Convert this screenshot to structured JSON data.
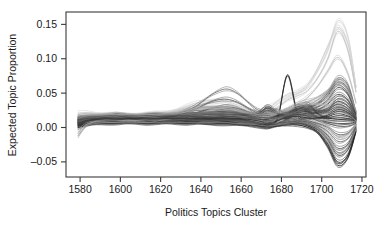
{
  "figure": {
    "background_color": "#ffffff",
    "frame_color": "#3a3a3a",
    "text_color": "#1a1a1a"
  },
  "chart_data": {
    "type": "line",
    "title": "",
    "xlabel": "Politics Topics Cluster",
    "ylabel": "Expected Topic Proportion",
    "xlim": [
      1573,
      1722
    ],
    "ylim": [
      -0.072,
      0.168
    ],
    "xticks": [
      1580,
      1600,
      1620,
      1640,
      1660,
      1680,
      1700,
      1720
    ],
    "xticklabels": [
      "1580",
      "1600",
      "1620",
      "1640",
      "1660",
      "1680",
      "1700",
      "1720"
    ],
    "yticks": [
      -0.05,
      0.0,
      0.05,
      0.1,
      0.15
    ],
    "yticklabels": [
      "-0.05",
      "0.00",
      "0.05",
      "0.10",
      "0.15"
    ],
    "grid": false,
    "legend": "none",
    "x": [
      1579,
      1583,
      1588,
      1593,
      1598,
      1603,
      1608,
      1613,
      1618,
      1623,
      1628,
      1633,
      1638,
      1643,
      1648,
      1653,
      1658,
      1663,
      1668,
      1673,
      1678,
      1683,
      1688,
      1693,
      1698,
      1703,
      1708,
      1713,
      1717
    ],
    "series": [
      {
        "name": "topic-01",
        "color": "#d0d0d0",
        "values": [
          0.021,
          0.022,
          0.021,
          0.02,
          0.019,
          0.019,
          0.02,
          0.02,
          0.021,
          0.023,
          0.026,
          0.031,
          0.036,
          0.039,
          0.04,
          0.038,
          0.033,
          0.027,
          0.024,
          0.028,
          0.038,
          0.048,
          0.052,
          0.062,
          0.086,
          0.118,
          0.146,
          0.122,
          0.06
        ]
      },
      {
        "name": "topic-02",
        "color": "#d6d6d6",
        "values": [
          0.018,
          0.019,
          0.019,
          0.018,
          0.018,
          0.018,
          0.018,
          0.019,
          0.02,
          0.022,
          0.025,
          0.029,
          0.033,
          0.035,
          0.035,
          0.033,
          0.029,
          0.025,
          0.023,
          0.026,
          0.034,
          0.044,
          0.05,
          0.06,
          0.082,
          0.112,
          0.155,
          0.132,
          0.058
        ]
      },
      {
        "name": "topic-03",
        "color": "#c4c4c4",
        "values": [
          0.016,
          0.017,
          0.017,
          0.017,
          0.017,
          0.017,
          0.017,
          0.018,
          0.019,
          0.021,
          0.024,
          0.027,
          0.029,
          0.03,
          0.029,
          0.027,
          0.024,
          0.021,
          0.019,
          0.021,
          0.029,
          0.04,
          0.046,
          0.054,
          0.072,
          0.1,
          0.14,
          0.112,
          0.052
        ]
      },
      {
        "name": "topic-04",
        "color": "#bdbdbd",
        "values": [
          0.015,
          0.016,
          0.016,
          0.016,
          0.016,
          0.016,
          0.017,
          0.017,
          0.018,
          0.019,
          0.021,
          0.023,
          0.025,
          0.026,
          0.026,
          0.025,
          0.022,
          0.019,
          0.016,
          0.016,
          0.02,
          0.026,
          0.034,
          0.044,
          0.06,
          0.082,
          0.102,
          0.078,
          0.036
        ]
      },
      {
        "name": "topic-05",
        "color": "#9a9a9a",
        "values": [
          0.014,
          0.015,
          0.016,
          0.015,
          0.015,
          0.016,
          0.016,
          0.017,
          0.018,
          0.019,
          0.02,
          0.021,
          0.022,
          0.023,
          0.024,
          0.023,
          0.021,
          0.018,
          0.015,
          0.014,
          0.017,
          0.022,
          0.028,
          0.033,
          0.04,
          0.052,
          0.063,
          0.05,
          0.024
        ]
      },
      {
        "name": "topic-06",
        "color": "#6e6e6e",
        "values": [
          0.013,
          0.015,
          0.016,
          0.016,
          0.016,
          0.016,
          0.016,
          0.016,
          0.016,
          0.017,
          0.019,
          0.024,
          0.032,
          0.043,
          0.052,
          0.056,
          0.05,
          0.038,
          0.026,
          0.02,
          0.021,
          0.024,
          0.028,
          0.03,
          0.036,
          0.05,
          0.072,
          0.062,
          0.022
        ]
      },
      {
        "name": "topic-07",
        "color": "#5c5c5c",
        "values": [
          0.012,
          0.014,
          0.015,
          0.015,
          0.015,
          0.016,
          0.016,
          0.016,
          0.016,
          0.017,
          0.018,
          0.022,
          0.028,
          0.035,
          0.04,
          0.041,
          0.037,
          0.029,
          0.021,
          0.017,
          0.019,
          0.022,
          0.026,
          0.029,
          0.034,
          0.046,
          0.066,
          0.056,
          0.02
        ]
      },
      {
        "name": "topic-08",
        "color": "#4a4a4a",
        "values": [
          0.011,
          0.013,
          0.014,
          0.015,
          0.015,
          0.015,
          0.015,
          0.015,
          0.015,
          0.016,
          0.017,
          0.019,
          0.022,
          0.026,
          0.029,
          0.03,
          0.028,
          0.023,
          0.018,
          0.015,
          0.017,
          0.02,
          0.024,
          0.026,
          0.03,
          0.04,
          0.058,
          0.048,
          0.018
        ]
      },
      {
        "name": "topic-09",
        "color": "#3d3d3d",
        "values": [
          0.01,
          0.012,
          0.014,
          0.015,
          0.015,
          0.015,
          0.015,
          0.015,
          0.015,
          0.015,
          0.016,
          0.017,
          0.019,
          0.021,
          0.023,
          0.024,
          0.023,
          0.02,
          0.016,
          0.014,
          0.016,
          0.019,
          0.022,
          0.024,
          0.026,
          0.034,
          0.048,
          0.04,
          0.016
        ]
      },
      {
        "name": "topic-10",
        "color": "#454545",
        "values": [
          0.012,
          0.014,
          0.015,
          0.016,
          0.016,
          0.016,
          0.016,
          0.016,
          0.016,
          0.016,
          0.016,
          0.017,
          0.018,
          0.019,
          0.02,
          0.021,
          0.02,
          0.018,
          0.015,
          0.013,
          0.014,
          0.016,
          0.019,
          0.021,
          0.023,
          0.028,
          0.038,
          0.032,
          0.014
        ]
      },
      {
        "name": "topic-11",
        "color": "#333333",
        "values": [
          0.009,
          0.011,
          0.013,
          0.014,
          0.014,
          0.014,
          0.015,
          0.015,
          0.015,
          0.015,
          0.015,
          0.015,
          0.015,
          0.016,
          0.017,
          0.018,
          0.018,
          0.017,
          0.015,
          0.014,
          0.015,
          0.017,
          0.019,
          0.02,
          0.021,
          0.024,
          0.03,
          0.025,
          0.013
        ]
      },
      {
        "name": "topic-12-spike",
        "color": "#222222",
        "values": [
          0.008,
          0.01,
          0.012,
          0.013,
          0.013,
          0.014,
          0.014,
          0.014,
          0.014,
          0.014,
          0.014,
          0.014,
          0.014,
          0.014,
          0.014,
          0.014,
          0.013,
          0.012,
          0.01,
          0.008,
          0.012,
          0.076,
          0.02,
          0.014,
          0.014,
          0.016,
          0.02,
          0.017,
          0.012
        ]
      },
      {
        "name": "topic-13",
        "color": "#3a3a3a",
        "values": [
          0.008,
          0.01,
          0.012,
          0.013,
          0.013,
          0.013,
          0.013,
          0.013,
          0.013,
          0.013,
          0.013,
          0.013,
          0.013,
          0.013,
          0.014,
          0.014,
          0.014,
          0.014,
          0.015,
          0.025,
          0.018,
          0.013,
          0.03,
          0.022,
          0.015,
          0.013,
          0.014,
          0.013,
          0.011
        ]
      },
      {
        "name": "topic-14",
        "color": "#2e2e2e",
        "values": [
          0.007,
          0.009,
          0.011,
          0.012,
          0.012,
          0.012,
          0.012,
          0.012,
          0.012,
          0.012,
          0.012,
          0.012,
          0.012,
          0.012,
          0.012,
          0.012,
          0.012,
          0.013,
          0.018,
          0.03,
          0.022,
          0.014,
          0.026,
          0.034,
          0.02,
          0.014,
          0.012,
          0.011,
          0.01
        ]
      },
      {
        "name": "topic-15",
        "color": "#404040",
        "values": [
          0.006,
          0.008,
          0.01,
          0.011,
          0.011,
          0.011,
          0.011,
          0.011,
          0.011,
          0.011,
          0.011,
          0.011,
          0.011,
          0.011,
          0.011,
          0.011,
          0.011,
          0.01,
          0.008,
          0.004,
          0.01,
          0.018,
          0.031,
          0.024,
          0.012,
          0.008,
          0.006,
          0.006,
          0.008
        ]
      },
      {
        "name": "topic-16",
        "color": "#4e4e4e",
        "values": [
          0.006,
          0.008,
          0.009,
          0.01,
          0.01,
          0.01,
          0.01,
          0.01,
          0.01,
          0.01,
          0.01,
          0.01,
          0.01,
          0.01,
          0.01,
          0.01,
          0.01,
          0.009,
          0.006,
          0.0,
          0.006,
          0.012,
          0.018,
          0.016,
          0.01,
          0.006,
          0.002,
          0.002,
          0.006
        ]
      },
      {
        "name": "topic-17",
        "color": "#565656",
        "values": [
          0.005,
          0.007,
          0.009,
          0.01,
          0.01,
          0.01,
          0.01,
          0.01,
          0.01,
          0.01,
          0.01,
          0.01,
          0.009,
          0.009,
          0.009,
          0.009,
          0.009,
          0.008,
          0.006,
          0.002,
          0.006,
          0.01,
          0.012,
          0.01,
          0.006,
          0.0,
          -0.01,
          -0.008,
          0.004
        ]
      },
      {
        "name": "topic-18",
        "color": "#636363",
        "values": [
          0.004,
          0.006,
          0.008,
          0.009,
          0.009,
          0.009,
          0.009,
          0.009,
          0.009,
          0.009,
          0.009,
          0.009,
          0.009,
          0.009,
          0.009,
          0.008,
          0.008,
          0.007,
          0.005,
          0.002,
          0.005,
          0.008,
          0.01,
          0.008,
          0.003,
          -0.006,
          -0.02,
          -0.016,
          0.002
        ]
      },
      {
        "name": "topic-19",
        "color": "#474747",
        "values": [
          0.004,
          0.006,
          0.008,
          0.008,
          0.008,
          0.008,
          0.008,
          0.008,
          0.008,
          0.008,
          0.008,
          0.008,
          0.008,
          0.008,
          0.008,
          0.008,
          0.007,
          0.006,
          0.004,
          0.002,
          0.004,
          0.007,
          0.008,
          0.006,
          0.0,
          -0.012,
          -0.03,
          -0.024,
          0.0
        ]
      },
      {
        "name": "topic-20",
        "color": "#3b3b3b",
        "values": [
          0.003,
          0.005,
          0.007,
          0.008,
          0.008,
          0.008,
          0.008,
          0.008,
          0.008,
          0.008,
          0.008,
          0.008,
          0.007,
          0.007,
          0.007,
          0.007,
          0.006,
          0.005,
          0.004,
          0.002,
          0.004,
          0.006,
          0.007,
          0.004,
          -0.003,
          -0.018,
          -0.04,
          -0.032,
          -0.002
        ]
      },
      {
        "name": "topic-21",
        "color": "#2b2b2b",
        "values": [
          0.002,
          0.004,
          0.006,
          0.007,
          0.007,
          0.007,
          0.007,
          0.007,
          0.007,
          0.007,
          0.007,
          0.007,
          0.007,
          0.006,
          0.006,
          0.006,
          0.005,
          0.004,
          0.003,
          0.001,
          0.003,
          0.005,
          0.006,
          0.002,
          -0.006,
          -0.024,
          -0.05,
          -0.04,
          -0.004
        ]
      },
      {
        "name": "topic-22",
        "color": "#1f1f1f",
        "values": [
          0.0,
          0.003,
          0.005,
          0.006,
          0.006,
          0.006,
          0.006,
          0.006,
          0.006,
          0.006,
          0.006,
          0.006,
          0.006,
          0.005,
          0.005,
          0.005,
          0.004,
          0.003,
          0.002,
          0.0,
          0.002,
          0.004,
          0.004,
          0.0,
          -0.008,
          -0.028,
          -0.055,
          -0.044,
          -0.006
        ]
      },
      {
        "name": "topic-23",
        "color": "#8a8a8a",
        "values": [
          -0.012,
          0.002,
          0.006,
          0.007,
          0.007,
          0.007,
          0.007,
          0.007,
          0.007,
          0.007,
          0.007,
          0.007,
          0.007,
          0.007,
          0.007,
          0.007,
          0.006,
          0.005,
          0.004,
          0.002,
          0.004,
          0.006,
          0.008,
          0.006,
          0.0,
          -0.016,
          -0.036,
          -0.028,
          -0.002
        ]
      },
      {
        "name": "topic-24",
        "color": "#a8a8a8",
        "values": [
          -0.006,
          0.004,
          0.009,
          0.01,
          0.01,
          0.01,
          0.01,
          0.01,
          0.011,
          0.012,
          0.014,
          0.016,
          0.018,
          0.019,
          0.019,
          0.018,
          0.016,
          0.013,
          0.011,
          0.01,
          0.013,
          0.017,
          0.02,
          0.018,
          0.012,
          0.002,
          -0.014,
          -0.01,
          0.004
        ]
      },
      {
        "name": "topic-25",
        "color": "#b5b5b5",
        "values": [
          0.01,
          0.013,
          0.015,
          0.016,
          0.016,
          0.016,
          0.016,
          0.016,
          0.017,
          0.018,
          0.02,
          0.023,
          0.026,
          0.028,
          0.028,
          0.027,
          0.024,
          0.02,
          0.017,
          0.016,
          0.02,
          0.026,
          0.032,
          0.034,
          0.034,
          0.032,
          0.028,
          0.022,
          0.01
        ]
      },
      {
        "name": "topic-26",
        "color": "#787878",
        "values": [
          0.013,
          0.015,
          0.017,
          0.018,
          0.018,
          0.018,
          0.018,
          0.018,
          0.018,
          0.019,
          0.02,
          0.021,
          0.022,
          0.022,
          0.022,
          0.022,
          0.021,
          0.019,
          0.017,
          0.022,
          0.026,
          0.019,
          0.024,
          0.03,
          0.026,
          0.022,
          0.024,
          0.02,
          0.012
        ]
      },
      {
        "name": "topic-27",
        "color": "#515151",
        "values": [
          0.011,
          0.013,
          0.015,
          0.016,
          0.017,
          0.017,
          0.017,
          0.017,
          0.017,
          0.017,
          0.017,
          0.018,
          0.018,
          0.019,
          0.019,
          0.019,
          0.019,
          0.019,
          0.02,
          0.028,
          0.02,
          0.016,
          0.022,
          0.028,
          0.024,
          0.026,
          0.034,
          0.028,
          0.014
        ]
      },
      {
        "name": "topic-28",
        "color": "#606060",
        "values": [
          0.009,
          0.011,
          0.013,
          0.014,
          0.014,
          0.014,
          0.014,
          0.014,
          0.014,
          0.014,
          0.014,
          0.014,
          0.014,
          0.015,
          0.015,
          0.016,
          0.016,
          0.015,
          0.014,
          0.01,
          0.014,
          0.018,
          0.02,
          0.018,
          0.018,
          0.024,
          0.042,
          0.036,
          0.015
        ]
      },
      {
        "name": "topic-29",
        "color": "#353535",
        "values": [
          0.007,
          0.01,
          0.012,
          0.013,
          0.013,
          0.013,
          0.013,
          0.013,
          0.013,
          0.013,
          0.013,
          0.013,
          0.013,
          0.013,
          0.013,
          0.013,
          0.013,
          0.012,
          0.01,
          0.006,
          0.01,
          0.015,
          0.016,
          0.014,
          0.014,
          0.018,
          0.026,
          0.022,
          0.012
        ]
      },
      {
        "name": "topic-30",
        "color": "#9e9e9e",
        "values": [
          0.016,
          0.018,
          0.019,
          0.019,
          0.019,
          0.019,
          0.019,
          0.019,
          0.019,
          0.02,
          0.022,
          0.025,
          0.028,
          0.03,
          0.03,
          0.029,
          0.026,
          0.022,
          0.019,
          0.018,
          0.022,
          0.028,
          0.034,
          0.038,
          0.044,
          0.054,
          0.068,
          0.054,
          0.024
        ]
      }
    ]
  }
}
